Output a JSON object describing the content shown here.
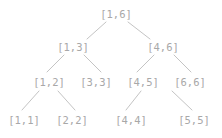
{
  "figure": {
    "name": "segment-tree-diagram",
    "width": 222,
    "height": 138,
    "background_color": "#ffffff",
    "node_text_color": "#a8a8a8",
    "edge_color": "#c4c4c4"
  },
  "tree": {
    "root_interval": "[1,6]",
    "levels": [
      {
        "level": 0,
        "nodes": [
          {
            "id": "n1_6",
            "label": "[1,6]",
            "x": 116,
            "y": 14
          }
        ]
      },
      {
        "level": 1,
        "nodes": [
          {
            "id": "n1_3",
            "label": "[1,3]",
            "x": 73,
            "y": 47
          },
          {
            "id": "n4_6",
            "label": "[4,6]",
            "x": 163,
            "y": 47
          }
        ]
      },
      {
        "level": 2,
        "nodes": [
          {
            "id": "n1_2",
            "label": "[1,2]",
            "x": 49,
            "y": 82
          },
          {
            "id": "n3_3",
            "label": "[3,3]",
            "x": 96,
            "y": 82
          },
          {
            "id": "n4_5",
            "label": "[4,5]",
            "x": 143,
            "y": 82
          },
          {
            "id": "n6_6",
            "label": "[6,6]",
            "x": 190,
            "y": 82
          }
        ]
      },
      {
        "level": 3,
        "nodes": [
          {
            "id": "n1_1",
            "label": "[1,1]",
            "x": 24,
            "y": 120
          },
          {
            "id": "n2_2",
            "label": "[2,2]",
            "x": 72,
            "y": 120
          },
          {
            "id": "n4_4",
            "label": "[4,4]",
            "x": 131,
            "y": 120
          },
          {
            "id": "n5_5",
            "label": "[5,5]",
            "x": 194,
            "y": 120
          }
        ]
      }
    ],
    "edges": [
      {
        "id": "e_root_left",
        "from": "[1,6]",
        "to": "[1,3]",
        "x1": 106,
        "y1": 22,
        "x2": 87,
        "y2": 39
      },
      {
        "id": "e_root_right",
        "from": "[1,6]",
        "to": "[4,6]",
        "x1": 128,
        "y1": 22,
        "x2": 150,
        "y2": 39
      },
      {
        "id": "e_13_left",
        "from": "[1,3]",
        "to": "[1,2]",
        "x1": 64,
        "y1": 55,
        "x2": 47,
        "y2": 72
      },
      {
        "id": "e_13_right",
        "from": "[1,3]",
        "to": "[3,3]",
        "x1": 84,
        "y1": 55,
        "x2": 101,
        "y2": 72
      },
      {
        "id": "e_46_left",
        "from": "[4,6]",
        "to": "[4,5]",
        "x1": 154,
        "y1": 55,
        "x2": 137,
        "y2": 72
      },
      {
        "id": "e_46_right",
        "from": "[4,6]",
        "to": "[6,6]",
        "x1": 174,
        "y1": 55,
        "x2": 191,
        "y2": 72
      },
      {
        "id": "e_12_left",
        "from": "[1,2]",
        "to": "[1,1]",
        "x1": 39,
        "y1": 91,
        "x2": 22,
        "y2": 110
      },
      {
        "id": "e_12_right",
        "from": "[1,2]",
        "to": "[2,2]",
        "x1": 58,
        "y1": 91,
        "x2": 75,
        "y2": 110
      },
      {
        "id": "e_45_left",
        "from": "[4,5]",
        "to": "[4,4]",
        "x1": 141,
        "y1": 91,
        "x2": 126,
        "y2": 110
      },
      {
        "id": "e_45_right",
        "from": "[4,5]",
        "to": "[5,5]",
        "x1": 172,
        "y1": 91,
        "x2": 192,
        "y2": 110
      }
    ]
  }
}
